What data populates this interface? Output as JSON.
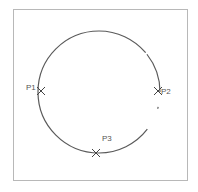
{
  "diagram": {
    "frame": {
      "x": 13,
      "y": 9,
      "width": 175,
      "height": 172,
      "stroke": "#b8b8b8"
    },
    "circle": {
      "cx": 99,
      "cy": 92,
      "r": 61,
      "stroke": "#5a5a5a",
      "stroke_width": 1.2
    },
    "points": [
      {
        "id": "P1",
        "label": "P1",
        "x": 41,
        "y": 91,
        "label_x": 26,
        "label_y": 90
      },
      {
        "id": "P2",
        "label": "P2",
        "x": 158,
        "y": 91,
        "label_x": 161,
        "label_y": 94
      },
      {
        "id": "P3",
        "label": "P3",
        "x": 96,
        "y": 153,
        "label_x": 102,
        "label_y": 141
      }
    ],
    "marker_style": "x-cross",
    "marker_color": "#444444"
  }
}
